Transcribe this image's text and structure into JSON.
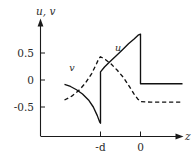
{
  "figure": {
    "width": 195,
    "height": 162,
    "background": "#ffffff",
    "ink_color": "#111111"
  },
  "chart_data": {
    "type": "line",
    "title": "",
    "subtitle": "",
    "xlabel": "z",
    "ylabel": "u, v",
    "axis_title_y": "u, v",
    "axis_title_x": "z",
    "grid": false,
    "legend": "inline-curve-labels",
    "xlim": [
      -1.9,
      1.1
    ],
    "ylim": [
      -1.05,
      1.0
    ],
    "x_tick_labels": [
      "-d",
      "0"
    ],
    "x_tick_values": [
      -1,
      0
    ],
    "y_tick_labels": [
      "0.5",
      "0",
      "-0.5"
    ],
    "y_tick_values": [
      0.5,
      0,
      -0.5
    ],
    "annotations": [
      {
        "text": "v",
        "x": -1.5,
        "y": 0.25,
        "style": "italic"
      },
      {
        "text": "u",
        "x": -0.55,
        "y": 0.62,
        "style": "italic"
      }
    ],
    "series": [
      {
        "name": "u",
        "label": "u",
        "style": "solid",
        "color": "#111111",
        "description": "Solid curve: decays from -0.08 at far left down to -0.80 just left of z=-d, jumps up to +0.15 at z=-d, rises to a peak of +0.85 just left of z=0, then drops vertically to -0.07 and stays flat for z>0.",
        "x": [
          -1.9,
          -1.75,
          -1.6,
          -1.45,
          -1.3,
          -1.18,
          -1.08,
          -1.02,
          -1.0,
          -1.0,
          -0.9,
          -0.78,
          -0.62,
          -0.45,
          -0.3,
          -0.16,
          -0.06,
          0.0,
          0.0,
          0.2,
          0.5,
          0.8,
          1.05
        ],
        "y": [
          -0.08,
          -0.12,
          -0.18,
          -0.26,
          -0.37,
          -0.5,
          -0.66,
          -0.78,
          -0.8,
          0.15,
          0.24,
          0.33,
          0.44,
          0.56,
          0.67,
          0.76,
          0.83,
          0.85,
          -0.07,
          -0.07,
          -0.07,
          -0.07,
          -0.07
        ]
      },
      {
        "name": "v",
        "label": "v",
        "style": "dashed",
        "color": "#111111",
        "description": "Dashed curve: rises from -0.37 at far left through 0 near z=-1.35, peaks at +0.43 just left of z=-d, kinks and decays past z=-d down to -0.41, then flat for z>0.",
        "x": [
          -1.9,
          -1.72,
          -1.55,
          -1.38,
          -1.22,
          -1.1,
          -1.04,
          -1.0,
          -0.88,
          -0.74,
          -0.58,
          -0.42,
          -0.28,
          -0.16,
          -0.07,
          0.0,
          0.25,
          0.55,
          0.85,
          1.05
        ],
        "y": [
          -0.37,
          -0.3,
          -0.2,
          -0.06,
          0.12,
          0.3,
          0.4,
          0.43,
          0.38,
          0.3,
          0.18,
          0.04,
          -0.12,
          -0.26,
          -0.35,
          -0.4,
          -0.41,
          -0.41,
          -0.41,
          -0.41
        ]
      }
    ]
  }
}
